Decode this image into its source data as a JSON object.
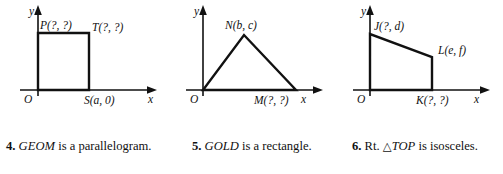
{
  "figures": [
    {
      "id": "figure-1",
      "shape": "square",
      "axis": {
        "x_label": "x",
        "y_label": "y",
        "origin_label": "O"
      },
      "points": [
        {
          "name": "P",
          "label": "P(?, ?)"
        },
        {
          "name": "T",
          "label": "T(?, ?)"
        },
        {
          "name": "S",
          "label": "S(a, 0)"
        }
      ]
    },
    {
      "id": "figure-2",
      "shape": "triangle",
      "axis": {
        "x_label": "x",
        "y_label": "y",
        "origin_label": "O"
      },
      "points": [
        {
          "name": "N",
          "label": "N(b, c)"
        },
        {
          "name": "M",
          "label": "M(?, ?)"
        }
      ]
    },
    {
      "id": "figure-3",
      "shape": "trapezoid",
      "axis": {
        "x_label": "x",
        "y_label": "y",
        "origin_label": "O"
      },
      "points": [
        {
          "name": "J",
          "label": "J(?, d)"
        },
        {
          "name": "L",
          "label": "L(e, f)"
        },
        {
          "name": "K",
          "label": "K(?, ?)"
        }
      ]
    }
  ],
  "captions": [
    {
      "number": "4.",
      "figure_name": "GEOM",
      "pre_text": "",
      "post_text": " is a parallelogram.",
      "full_text": "4. GEOM is a parallelogram."
    },
    {
      "number": "5.",
      "figure_name": "GOLD",
      "pre_text": "",
      "post_text": " is a rectangle.",
      "full_text": "5. GOLD is a rectangle."
    },
    {
      "number": "6.",
      "figure_name": "TOP",
      "pre_text": "Rt. ",
      "triangle_symbol": "△",
      "post_text": " is isosceles.",
      "full_text": "6. Rt. △TOP is isosceles."
    }
  ],
  "colors": {
    "ink": "#111111",
    "background": "#ffffff"
  }
}
